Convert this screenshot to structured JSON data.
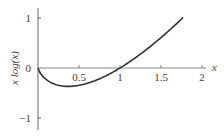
{
  "chart_data": {
    "type": "line",
    "title": "",
    "xlabel": "x",
    "ylabel": "x log(x)",
    "xlim": [
      0,
      2
    ],
    "ylim": [
      -1,
      1
    ],
    "grid": false,
    "legend": null,
    "x_ticks": [
      "0.5",
      "1",
      "1.5",
      "2"
    ],
    "y_ticks": [
      "1",
      "0",
      "−1"
    ],
    "series": [
      {
        "name": "x log(x)",
        "function": "x*ln(x)",
        "x_range": [
          0,
          1.77
        ],
        "x": [
          0.0,
          0.05,
          0.1,
          0.2,
          0.3,
          0.368,
          0.5,
          0.7,
          1.0,
          1.2,
          1.4,
          1.6,
          1.77
        ],
        "values": [
          0.0,
          -0.15,
          -0.23,
          -0.32,
          -0.36,
          -0.368,
          -0.35,
          -0.25,
          0.0,
          0.22,
          0.47,
          0.75,
          1.01
        ],
        "color": "#333333"
      }
    ]
  },
  "axes": {
    "x_title": "x",
    "y_title": "x log(x)",
    "x_tick_labels": [
      "0.5",
      "1",
      "1.5",
      "2"
    ],
    "y_tick_labels": [
      "1",
      "0",
      "−1"
    ]
  }
}
